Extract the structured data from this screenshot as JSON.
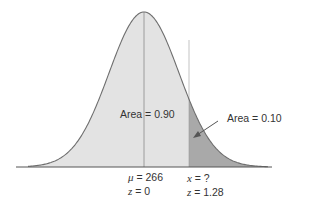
{
  "diagram": {
    "type": "normal-distribution",
    "mean_label": {
      "symbol": "μ",
      "value": "= 266"
    },
    "mean_z_label": {
      "symbol": "z",
      "value": "= 0"
    },
    "x_label": {
      "symbol": "x",
      "value": "= ?"
    },
    "x_z_label": {
      "symbol": "z",
      "value": "= 1.28"
    },
    "area_left_label": "Area = 0.90",
    "area_right_label": "Area = 0.10",
    "colors": {
      "curve": "#6e6e6e",
      "fill_main": "#e3e3e3",
      "fill_tail": "#a9a9a9",
      "axis": "#555555",
      "line": "#8a8a8a",
      "text": "#333333"
    }
  },
  "chart_data": {
    "type": "area",
    "title": "",
    "distribution": "normal",
    "mean": 266,
    "cutoff_z": 1.28,
    "cutoff_x": "?",
    "regions": [
      {
        "name": "left",
        "area": 0.9,
        "range_z": [
          null,
          1.28
        ]
      },
      {
        "name": "right_tail",
        "area": 0.1,
        "range_z": [
          1.28,
          null
        ]
      }
    ],
    "annotations": [
      "μ = 266",
      "z = 0",
      "x = ?",
      "z = 1.28",
      "Area = 0.90",
      "Area = 0.10"
    ]
  }
}
